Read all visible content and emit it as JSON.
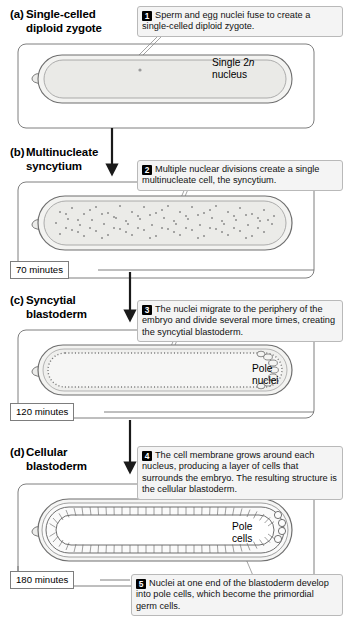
{
  "figure": {
    "organism_stage_count": 4
  },
  "panels": [
    {
      "id": "a",
      "letter": "(a)",
      "title_line1": "Single-celled",
      "title_line2": "diploid zygote",
      "labels": [
        {
          "name": "single-2n-nucleus",
          "line1": "Single 2",
          "italic": "n",
          "line2": "nucleus"
        }
      ]
    },
    {
      "id": "b",
      "letter": "(b)",
      "title_line1": "Multinucleate",
      "title_line2": "syncytium",
      "labels": []
    },
    {
      "id": "c",
      "letter": "(c)",
      "title_line1": "Syncytial",
      "title_line2": "blastoderm",
      "labels": [
        {
          "name": "pole-nuclei",
          "line1": "Pole",
          "line2": "nuclei"
        }
      ]
    },
    {
      "id": "d",
      "letter": "(d)",
      "title_line1": "Cellular",
      "title_line2": "blastoderm",
      "labels": [
        {
          "name": "pole-cells",
          "line1": "Pole",
          "line2": "cells"
        }
      ]
    }
  ],
  "steps": [
    {
      "number": "1",
      "text": "Sperm and egg nuclei fuse to create a single-celled diploid zygote."
    },
    {
      "number": "2",
      "text": "Multiple nuclear divisions create a single multinucleate cell, the syncytium."
    },
    {
      "number": "3",
      "text": "The nuclei migrate to the periphery of the embryo and divide several more times, creating the syncytial blastoderm."
    },
    {
      "number": "4",
      "text": "The cell membrane grows around each nucleus, producing a layer of cells that surrounds the embryo. The resulting structure is the cellular blastoderm."
    },
    {
      "number": "5",
      "text": "Nuclei at one end of the blastoderm develop into pole cells, which become the primordial germ cells."
    }
  ],
  "timings": [
    {
      "name": "time-70",
      "value": "70 minutes"
    },
    {
      "name": "time-120",
      "value": "120 minutes"
    },
    {
      "name": "time-180",
      "value": "180 minutes"
    }
  ],
  "colors": {
    "callout_bg": "#f4f4f4",
    "callout_border": "#b9b9b9",
    "badge_bg": "#000000",
    "badge_text": "#ffffff",
    "embryo_outline": "#6f6f6f",
    "embryo_fill": "#f0f0ef",
    "cytoplasm_fill": "#e8e8e6",
    "connector": "#1a1a1a",
    "page_bg": "#ffffff"
  }
}
